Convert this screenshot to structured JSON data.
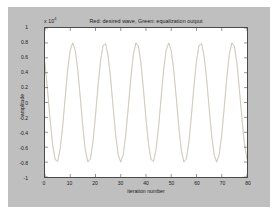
{
  "figure": {
    "background_color": "#bfbfbf",
    "page_background_color": "#ffffff",
    "axes_background_color": "#ffffff",
    "axes_border_color": "#4a4a4a"
  },
  "chart_data": {
    "type": "line",
    "title": "Red: desired wave, Green: equalization output",
    "xlabel": "iteration number",
    "ylabel": "amplitude",
    "y_multiplier_label": "x 10",
    "y_multiplier_exponent": "4",
    "y_multiplier": 10000,
    "grid": false,
    "legend": "none",
    "xlim": [
      0,
      80
    ],
    "ylim": [
      -1,
      1
    ],
    "xticks": [
      0,
      10,
      20,
      30,
      40,
      50,
      60,
      70,
      80
    ],
    "xtick_labels": [
      "0",
      "10",
      "20",
      "30",
      "40",
      "50",
      "60",
      "70",
      "80"
    ],
    "yticks": [
      1,
      0.8,
      0.6,
      0.4,
      0.2,
      0,
      -0.2,
      -0.4,
      -0.6,
      -0.8,
      -1
    ],
    "ytick_labels": [
      "1",
      "0.8",
      "0.6",
      "0.4",
      "0.2",
      "0",
      "-0.2",
      "-0.4",
      "-0.6",
      "-0.8",
      "-1"
    ],
    "waveform": {
      "shape": "sine",
      "amplitude": 0.8,
      "period": 8.0,
      "phase_deg": 40,
      "n_points": 81,
      "cycles_visible": 10
    },
    "series": [
      {
        "name": "Red: desired wave",
        "color": "#e8a0a0",
        "linewidth": 0.5,
        "x": [
          0,
          1,
          2,
          3,
          4,
          5,
          6,
          7,
          8,
          9,
          10,
          11,
          12,
          13,
          14,
          15,
          16,
          17,
          18,
          19,
          20,
          21,
          22,
          23,
          24,
          25,
          26,
          27,
          28,
          29,
          30,
          31,
          32,
          33,
          34,
          35,
          36,
          37,
          38,
          39,
          40,
          41,
          42,
          43,
          44,
          45,
          46,
          47,
          48,
          49,
          50,
          51,
          52,
          53,
          54,
          55,
          56,
          57,
          58,
          59,
          60,
          61,
          62,
          63,
          64,
          65,
          66,
          67,
          68,
          69,
          70,
          71,
          72,
          73,
          74,
          75,
          76,
          77,
          78,
          79,
          80
        ],
        "values": [
          0.51,
          0.16,
          -0.23,
          -0.57,
          -0.77,
          -0.79,
          -0.62,
          -0.31,
          0.08,
          0.45,
          0.71,
          0.8,
          0.69,
          0.42,
          0.05,
          -0.34,
          -0.65,
          -0.8,
          -0.75,
          -0.52,
          -0.16,
          0.23,
          0.57,
          0.77,
          0.79,
          0.62,
          0.31,
          -0.08,
          -0.45,
          -0.71,
          -0.8,
          -0.69,
          -0.42,
          -0.05,
          0.34,
          0.65,
          0.8,
          0.75,
          0.52,
          0.16,
          -0.23,
          -0.57,
          -0.77,
          -0.79,
          -0.62,
          -0.31,
          0.08,
          0.45,
          0.71,
          0.8,
          0.69,
          0.42,
          0.05,
          -0.34,
          -0.65,
          -0.8,
          -0.75,
          -0.52,
          -0.16,
          0.23,
          0.57,
          0.77,
          0.79,
          0.62,
          0.31,
          -0.08,
          -0.45,
          -0.71,
          -0.8,
          -0.69,
          -0.42,
          -0.05,
          0.34,
          0.65,
          0.8,
          0.75,
          0.52,
          0.16,
          -0.23,
          -0.57,
          -0.77
        ]
      },
      {
        "name": "Green: equalization output",
        "color": "#a8c8a8",
        "linewidth": 0.5,
        "x": [
          0,
          1,
          2,
          3,
          4,
          5,
          6,
          7,
          8,
          9,
          10,
          11,
          12,
          13,
          14,
          15,
          16,
          17,
          18,
          19,
          20,
          21,
          22,
          23,
          24,
          25,
          26,
          27,
          28,
          29,
          30,
          31,
          32,
          33,
          34,
          35,
          36,
          37,
          38,
          39,
          40,
          41,
          42,
          43,
          44,
          45,
          46,
          47,
          48,
          49,
          50,
          51,
          52,
          53,
          54,
          55,
          56,
          57,
          58,
          59,
          60,
          61,
          62,
          63,
          64,
          65,
          66,
          67,
          68,
          69,
          70,
          71,
          72,
          73,
          74,
          75,
          76,
          77,
          78,
          79,
          80
        ],
        "values": [
          0.55,
          0.18,
          -0.21,
          -0.55,
          -0.76,
          -0.79,
          -0.63,
          -0.33,
          0.06,
          0.43,
          0.7,
          0.8,
          0.7,
          0.44,
          0.07,
          -0.32,
          -0.64,
          -0.8,
          -0.76,
          -0.54,
          -0.18,
          0.21,
          0.55,
          0.76,
          0.79,
          0.63,
          0.33,
          -0.06,
          -0.43,
          -0.7,
          -0.8,
          -0.7,
          -0.44,
          -0.07,
          0.32,
          0.64,
          0.8,
          0.76,
          0.54,
          0.18,
          -0.21,
          -0.55,
          -0.76,
          -0.79,
          -0.63,
          -0.33,
          0.06,
          0.43,
          0.7,
          0.8,
          0.7,
          0.44,
          0.07,
          -0.32,
          -0.64,
          -0.8,
          -0.76,
          -0.54,
          -0.18,
          0.21,
          0.55,
          0.76,
          0.79,
          0.63,
          0.33,
          -0.06,
          -0.43,
          -0.7,
          -0.8,
          -0.7,
          -0.44,
          -0.07,
          0.32,
          0.64,
          0.8,
          0.76,
          0.54,
          0.18,
          -0.21,
          -0.55,
          -0.76
        ]
      }
    ]
  }
}
